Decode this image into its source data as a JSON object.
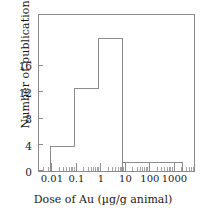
{
  "chart_data": {
    "type": "bar",
    "title": "",
    "xlabel": "Dose of Au (µg/g animal)",
    "ylabel": "Number of publications",
    "xscale": "log",
    "xlim": [
      0.0032,
      10000
    ],
    "ylim": [
      0,
      19
    ],
    "grid": false,
    "legend": null,
    "xticklabels": [
      "0.01",
      "0.1",
      "1",
      "10",
      "100",
      "1000"
    ],
    "xtickvalues": [
      0.01,
      0.1,
      1,
      10,
      100,
      1000
    ],
    "yticklabels": [
      "0",
      "4",
      "8",
      "12",
      "16"
    ],
    "ytickvalues": [
      0,
      4,
      8,
      12,
      16
    ],
    "bins": [
      {
        "label": "0.01–0.1",
        "x_start": 0.01,
        "x_end": 0.1,
        "value": 3
      },
      {
        "label": "0.1–1",
        "x_start": 0.1,
        "x_end": 1,
        "value": 10
      },
      {
        "label": "1–10",
        "x_start": 1,
        "x_end": 10,
        "value": 16
      },
      {
        "label": "10–3000",
        "x_start": 10,
        "x_end": 3000,
        "value": 1
      }
    ],
    "categories": [
      "0.01–0.1",
      "0.1–1",
      "1–10",
      "10–3000"
    ],
    "values": [
      3,
      10,
      16,
      1
    ],
    "style": {
      "bar_fill": "#ffffff",
      "bar_stroke": "#8c8c8c",
      "axis_color": "#8c8c8c",
      "text_color": "#1a1a1a"
    }
  },
  "axes": {
    "y_title": "Number of publications",
    "x_title_prefix": "Dose of Au (",
    "x_title_unit": "µg/g animal",
    "x_title_suffix": ")",
    "y_ticks": [
      {
        "label": "16"
      },
      {
        "label": "12"
      },
      {
        "label": "8"
      },
      {
        "label": "4"
      },
      {
        "label": "0"
      }
    ],
    "x_ticks": [
      {
        "label": "0.01"
      },
      {
        "label": "0.1"
      },
      {
        "label": "1"
      },
      {
        "label": "10"
      },
      {
        "label": "100"
      },
      {
        "label": "1000"
      }
    ]
  }
}
